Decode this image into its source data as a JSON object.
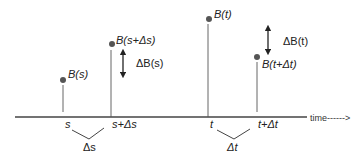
{
  "diagram": {
    "type": "brownian-increment-timeline",
    "colors": {
      "line": "#444444",
      "dot": "#555555",
      "text": "#222222",
      "background": "#ffffff"
    },
    "axis": {
      "label": "time------>",
      "y": 117,
      "x_start": 15,
      "x_end": 307
    },
    "points": [
      {
        "id": "Bs",
        "label": "B(s)",
        "x": 63,
        "y": 80,
        "tick_label": "s"
      },
      {
        "id": "Bs_ds",
        "label": "B(s+Δs)",
        "x": 112,
        "y": 44,
        "tick_label": "s+Δs"
      },
      {
        "id": "Bt",
        "label": "B(t)",
        "x": 209,
        "y": 19,
        "tick_label": "t"
      },
      {
        "id": "Bt_dt",
        "label": "B(t+Δt)",
        "x": 257,
        "y": 57,
        "tick_label": "t+Δt"
      }
    ],
    "increments": [
      {
        "id": "dBs",
        "label": "ΔB(s)",
        "arrow_x": 123,
        "y_top": 49,
        "y_bottom": 78
      },
      {
        "id": "dBt",
        "label": "ΔB(t)",
        "arrow_x": 268,
        "y_top": 25,
        "y_bottom": 55
      }
    ],
    "intervals": [
      {
        "id": "ds",
        "label": "Δs"
      },
      {
        "id": "dt",
        "label": "Δt"
      }
    ]
  }
}
